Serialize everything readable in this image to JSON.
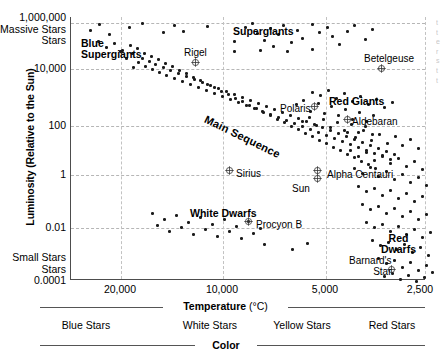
{
  "chart_data": {
    "type": "scatter",
    "title": "",
    "xlabel": "Temperature (°C)",
    "ylabel": "Luminosity (Relative to the Sun)",
    "xlim": [
      25000,
      2400
    ],
    "ylim": [
      0.0001,
      1000000
    ],
    "x_scale": "reversed-log",
    "y_scale": "log",
    "grid": true,
    "legend": "none",
    "xticks": [
      "20,000",
      "10,000",
      "5,000",
      "2,500"
    ],
    "xtick_values": [
      20000,
      10000,
      5000,
      2500
    ],
    "yticks": [
      "1,000,000",
      "10,000",
      "100",
      "1",
      "0.01",
      "0.0001"
    ],
    "ytick_values": [
      1000000,
      10000,
      100,
      1,
      0.01,
      0.0001
    ],
    "y_axis_end_notes": {
      "top": "Massive Stars",
      "bottom": "Small Stars"
    },
    "secondary_axis": {
      "label": "Color",
      "categories": [
        "Blue Stars",
        "White Stars",
        "Yellow Stars",
        "Red Stars"
      ]
    },
    "region_labels": [
      {
        "text": "Blue Supergiants",
        "x": 80,
        "y": 38
      },
      {
        "text": "Supergiants",
        "x": 232,
        "y": 26
      },
      {
        "text": "Red Giants",
        "x": 328,
        "y": 96
      },
      {
        "text": "Main Sequence",
        "x": 137,
        "y": 96
      },
      {
        "text": "White Dwarfs",
        "x": 189,
        "y": 208
      },
      {
        "text": "Red Dwarfs",
        "x": 380,
        "y": 233
      }
    ],
    "named_stars": [
      {
        "name": "Rigel",
        "label_x": 183,
        "label_y": 48,
        "marker_x": 194,
        "marker_y": 62
      },
      {
        "name": "Betelgeuse",
        "label_x": 363,
        "label_y": 54,
        "marker_x": 380,
        "marker_y": 68
      },
      {
        "name": "Polaris",
        "label_x": 279,
        "label_y": 104,
        "marker_x": 313,
        "marker_y": 106
      },
      {
        "name": "Aldebaran",
        "label_x": 351,
        "label_y": 117,
        "marker_x": 346,
        "marker_y": 119
      },
      {
        "name": "Sirius",
        "label_x": 235,
        "label_y": 169,
        "marker_x": 228,
        "marker_y": 170
      },
      {
        "name": "Alpha Centauri",
        "label_x": 326,
        "label_y": 170,
        "marker_x": 316,
        "marker_y": 170
      },
      {
        "name": "Sun",
        "label_x": 291,
        "label_y": 184,
        "marker_x": 316,
        "marker_y": 178
      },
      {
        "name": "Procyon B",
        "label_x": 255,
        "label_y": 220,
        "marker_x": 247,
        "marker_y": 221
      },
      {
        "name": "Barnard's Star",
        "label_x": 348,
        "label_y": 255,
        "marker_x": 390,
        "marker_y": 269
      }
    ],
    "points": [
      [
        88,
        29
      ],
      [
        97,
        23
      ],
      [
        107,
        33
      ],
      [
        127,
        26
      ],
      [
        140,
        22
      ],
      [
        161,
        31
      ],
      [
        172,
        24
      ],
      [
        181,
        30
      ],
      [
        205,
        25
      ],
      [
        232,
        40
      ],
      [
        243,
        26
      ],
      [
        250,
        22
      ],
      [
        255,
        32
      ],
      [
        262,
        39
      ],
      [
        268,
        27
      ],
      [
        271,
        45
      ],
      [
        276,
        33
      ],
      [
        281,
        24
      ],
      [
        289,
        41
      ],
      [
        295,
        29
      ],
      [
        300,
        37
      ],
      [
        310,
        23
      ],
      [
        317,
        31
      ],
      [
        325,
        26
      ],
      [
        330,
        35
      ],
      [
        337,
        43
      ],
      [
        345,
        30
      ],
      [
        352,
        24
      ],
      [
        363,
        38
      ],
      [
        370,
        28
      ],
      [
        310,
        48
      ],
      [
        285,
        50
      ],
      [
        258,
        49
      ],
      [
        232,
        50
      ],
      [
        118,
        50
      ],
      [
        124,
        57
      ],
      [
        130,
        52
      ],
      [
        136,
        61
      ],
      [
        131,
        66
      ],
      [
        140,
        57
      ],
      [
        143,
        65
      ],
      [
        147,
        60
      ],
      [
        150,
        68
      ],
      [
        153,
        63
      ],
      [
        157,
        71
      ],
      [
        161,
        66
      ],
      [
        164,
        74
      ],
      [
        168,
        69
      ],
      [
        172,
        77
      ],
      [
        176,
        72
      ],
      [
        180,
        80
      ],
      [
        184,
        75
      ],
      [
        188,
        83
      ],
      [
        192,
        78
      ],
      [
        196,
        86
      ],
      [
        200,
        81
      ],
      [
        204,
        89
      ],
      [
        208,
        84
      ],
      [
        212,
        92
      ],
      [
        216,
        87
      ],
      [
        220,
        95
      ],
      [
        224,
        90
      ],
      [
        228,
        98
      ],
      [
        232,
        93
      ],
      [
        236,
        101
      ],
      [
        240,
        96
      ],
      [
        244,
        104
      ],
      [
        248,
        99
      ],
      [
        252,
        107
      ],
      [
        256,
        102
      ],
      [
        260,
        110
      ],
      [
        264,
        105
      ],
      [
        268,
        113
      ],
      [
        272,
        108
      ],
      [
        276,
        116
      ],
      [
        280,
        111
      ],
      [
        284,
        119
      ],
      [
        288,
        114
      ],
      [
        292,
        122
      ],
      [
        296,
        117
      ],
      [
        300,
        125
      ],
      [
        304,
        120
      ],
      [
        308,
        128
      ],
      [
        312,
        123
      ],
      [
        316,
        131
      ],
      [
        320,
        126
      ],
      [
        324,
        134
      ],
      [
        328,
        129
      ],
      [
        332,
        137
      ],
      [
        336,
        132
      ],
      [
        340,
        140
      ],
      [
        344,
        135
      ],
      [
        348,
        143
      ],
      [
        352,
        138
      ],
      [
        356,
        146
      ],
      [
        360,
        141
      ],
      [
        364,
        149
      ],
      [
        368,
        144
      ],
      [
        372,
        152
      ],
      [
        376,
        147
      ],
      [
        380,
        155
      ],
      [
        384,
        150
      ],
      [
        388,
        158
      ],
      [
        392,
        153
      ],
      [
        128,
        44
      ],
      [
        135,
        47
      ],
      [
        142,
        52
      ],
      [
        149,
        55
      ],
      [
        156,
        58
      ],
      [
        163,
        62
      ],
      [
        170,
        65
      ],
      [
        177,
        69
      ],
      [
        184,
        72
      ],
      [
        191,
        76
      ],
      [
        198,
        79
      ],
      [
        205,
        83
      ],
      [
        212,
        86
      ],
      [
        219,
        90
      ],
      [
        226,
        93
      ],
      [
        233,
        97
      ],
      [
        240,
        100
      ],
      [
        247,
        104
      ],
      [
        254,
        107
      ],
      [
        261,
        111
      ],
      [
        268,
        114
      ],
      [
        275,
        118
      ],
      [
        282,
        121
      ],
      [
        289,
        125
      ],
      [
        296,
        128
      ],
      [
        303,
        132
      ],
      [
        310,
        135
      ],
      [
        317,
        139
      ],
      [
        324,
        142
      ],
      [
        331,
        146
      ],
      [
        338,
        149
      ],
      [
        345,
        153
      ],
      [
        352,
        156
      ],
      [
        359,
        160
      ],
      [
        366,
        163
      ],
      [
        373,
        167
      ],
      [
        294,
        103
      ],
      [
        301,
        99
      ],
      [
        308,
        110
      ],
      [
        316,
        102
      ],
      [
        322,
        112
      ],
      [
        329,
        105
      ],
      [
        336,
        114
      ],
      [
        343,
        108
      ],
      [
        350,
        118
      ],
      [
        357,
        111
      ],
      [
        364,
        120
      ],
      [
        371,
        114
      ],
      [
        300,
        120
      ],
      [
        307,
        116
      ],
      [
        314,
        124
      ],
      [
        321,
        118
      ],
      [
        328,
        126
      ],
      [
        335,
        121
      ],
      [
        342,
        129
      ],
      [
        349,
        123
      ],
      [
        356,
        131
      ],
      [
        363,
        125
      ],
      [
        370,
        133
      ],
      [
        310,
        91
      ],
      [
        318,
        94
      ],
      [
        326,
        89
      ],
      [
        334,
        97
      ],
      [
        342,
        92
      ],
      [
        350,
        100
      ],
      [
        358,
        95
      ],
      [
        366,
        103
      ],
      [
        374,
        98
      ],
      [
        382,
        106
      ],
      [
        390,
        101
      ],
      [
        345,
        131
      ],
      [
        353,
        136
      ],
      [
        361,
        129
      ],
      [
        369,
        139
      ],
      [
        377,
        133
      ],
      [
        385,
        142
      ],
      [
        393,
        135
      ],
      [
        400,
        144
      ],
      [
        408,
        138
      ],
      [
        416,
        147
      ],
      [
        348,
        149
      ],
      [
        356,
        155
      ],
      [
        364,
        151
      ],
      [
        372,
        159
      ],
      [
        380,
        154
      ],
      [
        388,
        162
      ],
      [
        396,
        157
      ],
      [
        404,
        165
      ],
      [
        412,
        160
      ],
      [
        420,
        168
      ],
      [
        352,
        167
      ],
      [
        360,
        172
      ],
      [
        368,
        166
      ],
      [
        376,
        175
      ],
      [
        384,
        170
      ],
      [
        392,
        178
      ],
      [
        400,
        173
      ],
      [
        408,
        181
      ],
      [
        416,
        176
      ],
      [
        424,
        184
      ],
      [
        356,
        185
      ],
      [
        364,
        190
      ],
      [
        372,
        187
      ],
      [
        380,
        194
      ],
      [
        388,
        189
      ],
      [
        396,
        197
      ],
      [
        404,
        192
      ],
      [
        412,
        200
      ],
      [
        420,
        195
      ],
      [
        360,
        203
      ],
      [
        368,
        208
      ],
      [
        376,
        205
      ],
      [
        384,
        212
      ],
      [
        392,
        207
      ],
      [
        400,
        215
      ],
      [
        408,
        210
      ],
      [
        416,
        218
      ],
      [
        424,
        213
      ],
      [
        364,
        221
      ],
      [
        372,
        226
      ],
      [
        380,
        223
      ],
      [
        388,
        230
      ],
      [
        396,
        225
      ],
      [
        404,
        233
      ],
      [
        412,
        228
      ],
      [
        420,
        236
      ],
      [
        428,
        231
      ],
      [
        370,
        239
      ],
      [
        378,
        244
      ],
      [
        386,
        241
      ],
      [
        394,
        248
      ],
      [
        402,
        243
      ],
      [
        410,
        251
      ],
      [
        418,
        246
      ],
      [
        426,
        254
      ],
      [
        376,
        257
      ],
      [
        384,
        262
      ],
      [
        392,
        259
      ],
      [
        400,
        266
      ],
      [
        408,
        261
      ],
      [
        416,
        269
      ],
      [
        424,
        264
      ],
      [
        430,
        271
      ],
      [
        382,
        275
      ],
      [
        390,
        272
      ],
      [
        398,
        278
      ],
      [
        406,
        274
      ],
      [
        414,
        280
      ],
      [
        422,
        276
      ],
      [
        150,
        212
      ],
      [
        162,
        218
      ],
      [
        174,
        214
      ],
      [
        186,
        221
      ],
      [
        198,
        216
      ],
      [
        210,
        223
      ],
      [
        222,
        218
      ],
      [
        234,
        225
      ],
      [
        246,
        220
      ],
      [
        258,
        227
      ],
      [
        155,
        224
      ],
      [
        167,
        230
      ],
      [
        179,
        226
      ],
      [
        191,
        233
      ],
      [
        203,
        228
      ],
      [
        215,
        235
      ],
      [
        227,
        230
      ],
      [
        239,
        237
      ],
      [
        251,
        232
      ],
      [
        262,
        243
      ],
      [
        290,
        248
      ],
      [
        305,
        242
      ],
      [
        96,
        40
      ],
      [
        104,
        46
      ],
      [
        112,
        42
      ],
      [
        120,
        49
      ]
    ]
  },
  "right_margin_text": [
    "t",
    "t",
    "e",
    "r",
    "s",
    "t",
    "t"
  ]
}
